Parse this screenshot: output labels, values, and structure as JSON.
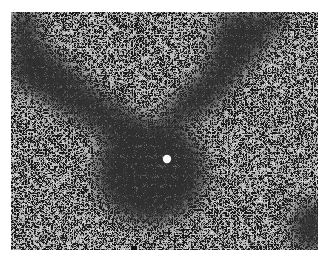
{
  "image": {
    "kind": "grayscale histology micrograph",
    "description": "Tissue section showing a dense, dark-staining cellular nodule with a small round clear lumen near its center, extending as dark cellular bands toward the upper-left and upper-right, surrounded by lighter parenchyma with scattered dark nuclei and small clear vacuoles.",
    "frame": {
      "left": 11,
      "top": 12,
      "right": 318,
      "bottom": 250
    },
    "colors": {
      "background": "#ffffff",
      "parenchyma": "#b4b4b4",
      "dense_region": "#555555",
      "nucleus": "#2a2a2a",
      "vacuole": "#f0f0f0"
    },
    "features": {
      "central_lumen": {
        "cx": 167,
        "cy": 159,
        "r": 4
      },
      "nodule": {
        "cx": 150,
        "cy": 170,
        "rx": 58,
        "ry": 55
      },
      "bottom_mark": {
        "x": 133,
        "y": 248
      }
    }
  }
}
